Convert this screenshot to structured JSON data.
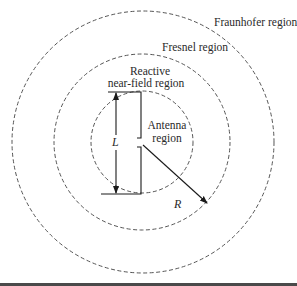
{
  "diagram": {
    "regions": [
      {
        "id": "antenna",
        "label_lines": [
          "Antenna",
          "region"
        ]
      },
      {
        "id": "reactive-near-field",
        "label_lines": [
          "Reactive",
          "near-field region"
        ]
      },
      {
        "id": "fresnel",
        "label_lines": [
          "Fresnel region"
        ]
      },
      {
        "id": "fraunhofer",
        "label_lines": [
          "Fraunhofer region"
        ]
      }
    ],
    "dimensions": {
      "antenna_length_symbol": "L",
      "radius_symbol": "R"
    },
    "colors": {
      "boundary": "#555555",
      "line": "#1a1a1a",
      "text": "#2a2a2a",
      "bottom_bar": "#4a4a4a"
    }
  }
}
